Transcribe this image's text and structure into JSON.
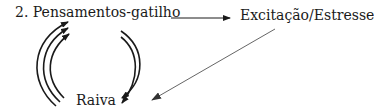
{
  "diagram": {
    "nodes": [
      {
        "id": "triggers",
        "label": "2. Pensamentos-gatilho"
      },
      {
        "id": "arousal",
        "label": "Excitação/Estresse"
      },
      {
        "id": "anger",
        "label": "Raiva"
      }
    ],
    "edges": [
      {
        "from": "triggers",
        "to": "arousal",
        "style": "single arrow"
      },
      {
        "from": "arousal",
        "to": "anger",
        "style": "single thin gray arrow"
      },
      {
        "from": "anger",
        "to": "triggers",
        "style": "triple curved arrows (left side)"
      },
      {
        "from": "triggers",
        "to": "anger",
        "style": "double curved arrows (right side)"
      }
    ],
    "colors": {
      "ink": "#1a1a1a",
      "diagonal": "#666666"
    }
  }
}
